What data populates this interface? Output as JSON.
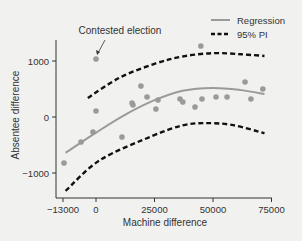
{
  "chart_data": {
    "type": "scatter",
    "title": "",
    "xlabel": "Machine difference",
    "ylabel": "Absentee difference",
    "xlim": [
      -13000,
      75000
    ],
    "ylim": [
      -1600,
      1500
    ],
    "xticks": [
      -13000,
      0,
      25000,
      50000,
      75000
    ],
    "xtick_labels": [
      "−13000",
      "0",
      "25000",
      "50000",
      "75000"
    ],
    "yticks": [
      1000,
      0,
      -1000
    ],
    "ytick_labels": [
      "1000",
      "0",
      "−1000"
    ],
    "grid": false,
    "legend_position": "top-right",
    "legend": [
      {
        "label": "Regression",
        "style": "solid",
        "color": "#9a9a9a"
      },
      {
        "label": "95% PI",
        "style": "dashed",
        "color": "#111111"
      }
    ],
    "annotation": {
      "text": "Contested election",
      "target": [
        0,
        1036
      ]
    },
    "series": [
      {
        "name": "Observations",
        "type": "scatter",
        "color": "#9a9a9a",
        "points": [
          [
            -13000,
            -821
          ],
          [
            -6400,
            -446
          ],
          [
            -1300,
            -268
          ],
          [
            0,
            107
          ],
          [
            0,
            1036
          ],
          [
            11100,
            -357
          ],
          [
            15400,
            250
          ],
          [
            15800,
            214
          ],
          [
            19200,
            554
          ],
          [
            21800,
            357
          ],
          [
            26500,
            304
          ],
          [
            25600,
            143
          ],
          [
            35900,
            321
          ],
          [
            37100,
            268
          ],
          [
            42300,
            179
          ],
          [
            45300,
            321
          ],
          [
            44800,
            1268
          ],
          [
            51300,
            357
          ],
          [
            56000,
            357
          ],
          [
            63700,
            625
          ],
          [
            66200,
            321
          ],
          [
            71300,
            500
          ]
        ]
      },
      {
        "name": "Regression",
        "type": "line",
        "points": [
          [
            -13000,
            -640
          ],
          [
            0,
            -280
          ],
          [
            12000,
            30
          ],
          [
            25000,
            300
          ],
          [
            37000,
            470
          ],
          [
            50000,
            520
          ],
          [
            62000,
            480
          ],
          [
            72000,
            410
          ]
        ]
      },
      {
        "name": "95% PI upper",
        "type": "line",
        "points": [
          [
            -3500,
            340
          ],
          [
            10000,
            700
          ],
          [
            25000,
            950
          ],
          [
            37000,
            1080
          ],
          [
            50000,
            1140
          ],
          [
            62000,
            1120
          ],
          [
            72000,
            1090
          ]
        ]
      },
      {
        "name": "95% PI lower",
        "type": "line",
        "points": [
          [
            -13000,
            -1320
          ],
          [
            1700,
            -770
          ],
          [
            24000,
            -340
          ],
          [
            37000,
            -150
          ],
          [
            46000,
            -110
          ],
          [
            58000,
            -140
          ],
          [
            72000,
            -290
          ]
        ]
      }
    ]
  }
}
